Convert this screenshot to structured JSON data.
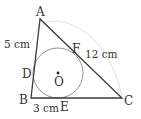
{
  "diagram": {
    "type": "triangle-with-incircle",
    "colors": {
      "triangle_stroke": "#3a3a3a",
      "circle_stroke": "#8a8a8a",
      "arc_stroke": "#dddddd",
      "text": "#333333"
    },
    "vertices": {
      "A": {
        "label": "A",
        "x": 40,
        "y": 19
      },
      "B": {
        "label": "B",
        "x": 31,
        "y": 98
      },
      "C": {
        "label": "C",
        "x": 122,
        "y": 98
      }
    },
    "tangent_points": {
      "D": {
        "label": "D",
        "on": "AB"
      },
      "E": {
        "label": "E",
        "on": "BC"
      },
      "F": {
        "label": "F",
        "on": "AC"
      }
    },
    "center": {
      "label": "O",
      "x": 58,
      "y": 73,
      "radius": 25
    },
    "measurements": {
      "AD": "5 cm",
      "FC": "12 cm",
      "BE": "3 cm"
    }
  }
}
